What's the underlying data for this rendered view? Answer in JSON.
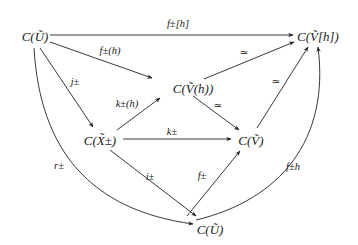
{
  "diagram": {
    "type": "commutative-diagram",
    "nodes": {
      "cu_top": "C(Ũ)",
      "cvh_bracket": "C(Ṽ[h])",
      "cvh_paren": "C(Ṽ(h))",
      "cx": "C(X̃±)",
      "cv": "C(Ṽ)",
      "cu_bottom": "C(Ũ)"
    },
    "edges": {
      "f_bracket": "f±[h]",
      "f_paren": "f±(h)",
      "j": "j±",
      "k_h": "k±(h)",
      "k": "k±",
      "iso_1": "≃",
      "iso_2": "≃",
      "iso_3": "≃",
      "r": "r±",
      "i": "i±",
      "f": "f±",
      "f_h": "f±h"
    },
    "edge_list": [
      {
        "from": "C(Ũ)",
        "to": "C(Ṽ[h])",
        "label": "f±[h]"
      },
      {
        "from": "C(Ũ)",
        "to": "C(Ṽ(h))",
        "label": "f±(h)"
      },
      {
        "from": "C(Ũ)",
        "to": "C(X̃±)",
        "label": "j±"
      },
      {
        "from": "C(Ũ)",
        "to": "C(Ũ) (bottom)",
        "label": "r±"
      },
      {
        "from": "C(X̃±)",
        "to": "C(Ṽ(h))",
        "label": "k±(h)"
      },
      {
        "from": "C(X̃±)",
        "to": "C(Ṽ)",
        "label": "k±"
      },
      {
        "from": "C(X̃±)",
        "to": "C(Ũ) (bottom)",
        "label": "i±"
      },
      {
        "from": "C(Ṽ(h))",
        "to": "C(Ṽ[h])",
        "label": "≃"
      },
      {
        "from": "C(Ṽ(h))",
        "to": "C(Ṽ)",
        "label": "≃"
      },
      {
        "from": "C(Ṽ)",
        "to": "C(Ṽ[h])",
        "label": "≃"
      },
      {
        "from": "C(Ũ) (bottom)",
        "to": "C(Ṽ)",
        "label": "f±"
      },
      {
        "from": "C(Ũ) (bottom)",
        "to": "C(Ṽ[h])",
        "label": "f±h"
      }
    ]
  }
}
